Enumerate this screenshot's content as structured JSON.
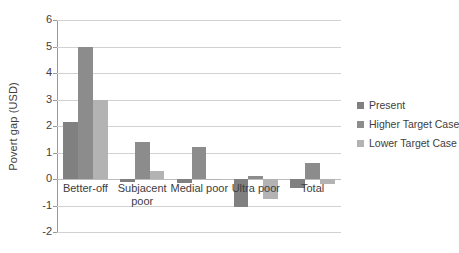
{
  "chart_data": {
    "type": "bar",
    "title": "",
    "xlabel": "",
    "ylabel": "Povert gap (USD)",
    "ylim": [
      -2,
      6
    ],
    "yticks": [
      -2,
      -1,
      0,
      1,
      2,
      3,
      4,
      5,
      6
    ],
    "ytick_labels": [
      "-2",
      "-1",
      "0",
      "1",
      "2",
      "3",
      "4",
      "5",
      "6"
    ],
    "grid": true,
    "legend_position": "right",
    "categories": [
      "Better-off",
      "Subjacent poor",
      "Medial poor",
      "Ultra poor",
      "Total"
    ],
    "category_lines": [
      [
        "Better-off"
      ],
      [
        "Subjacent",
        "poor"
      ],
      [
        "Medial poor"
      ],
      [
        "Ultra poor"
      ],
      [
        "Total"
      ]
    ],
    "series": [
      {
        "name": "Present",
        "color": "#808080",
        "values": [
          2.15,
          -0.1,
          -0.15,
          -1.05,
          -0.35
        ]
      },
      {
        "name": "Higher Target Case",
        "color": "#8c8c8c",
        "values": [
          5.0,
          1.38,
          1.22,
          0.12,
          0.6
        ]
      },
      {
        "name": "Lower Target Case",
        "color": "#b3b3b3",
        "values": [
          3.0,
          0.32,
          -0.03,
          -0.75,
          -0.2
        ]
      }
    ]
  },
  "legend": {
    "items": [
      {
        "label": "Present",
        "color": "#808080"
      },
      {
        "label": "Higher Target Case",
        "color": "#8c8c8c"
      },
      {
        "label": "Lower Target Case",
        "color": "#b3b3b3"
      }
    ]
  },
  "axes": {
    "y_title": "Povert gap (USD)"
  }
}
